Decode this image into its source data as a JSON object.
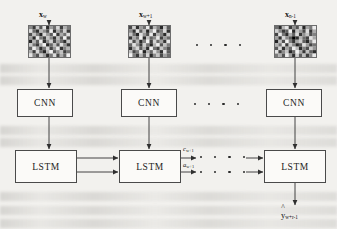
{
  "figure": {
    "background_color": "#f2f1ee",
    "line_color": "#3a3a3a"
  },
  "inputs": [
    {
      "id": "input-1",
      "symbol": "x",
      "subscript": "w",
      "patch_label": "noisy-grayscale-patch"
    },
    {
      "id": "input-2",
      "symbol": "x",
      "subscript": "w+1",
      "patch_label": "noisy-grayscale-patch"
    },
    {
      "id": "input-3",
      "symbol": "x",
      "subscript": "n-1",
      "patch_label": "noisy-grayscale-patch"
    }
  ],
  "cnn_blocks": [
    {
      "id": "cnn-1",
      "label": "CNN"
    },
    {
      "id": "cnn-2",
      "label": "CNN"
    },
    {
      "id": "cnn-3",
      "label": "CNN"
    }
  ],
  "lstm_blocks": [
    {
      "id": "lstm-1",
      "label": "LSTM"
    },
    {
      "id": "lstm-2",
      "label": "LSTM"
    },
    {
      "id": "lstm-3",
      "label": "LSTM"
    }
  ],
  "state_labels": [
    {
      "id": "cell-state",
      "symbol": "c",
      "subscript": "w+1"
    },
    {
      "id": "hidden-state",
      "symbol": "a",
      "subscript": "w+1"
    }
  ],
  "output": {
    "symbol": "y",
    "subscript": "w+r-1",
    "hat": true
  },
  "ellipses": [
    {
      "id": "ellipsis-input-row",
      "count": 4
    },
    {
      "id": "ellipsis-cnn-row",
      "count": 4
    },
    {
      "id": "ellipsis-lstm-cell-row",
      "count": 4
    },
    {
      "id": "ellipsis-lstm-hidden-row",
      "count": 4
    }
  ]
}
